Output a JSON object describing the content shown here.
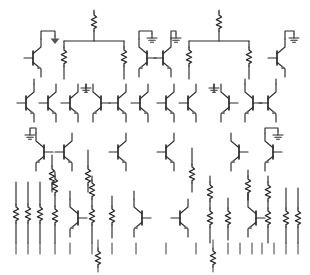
{
  "document": {
    "kind": "circuit-schematic",
    "title": "Transistor and resistor network schematic",
    "background_color": "#ffffff",
    "line_color": "#2b2b2b",
    "width": 310,
    "height": 275
  },
  "legend": {
    "symbols": [
      {
        "name": "resistor",
        "glyph": "zigzag",
        "count": 34
      },
      {
        "name": "bjt-transistor",
        "glyph": "bipolar-junction-transistor",
        "count": 22
      },
      {
        "name": "ground",
        "glyph": "earth-ground",
        "count": 9
      },
      {
        "name": "wire",
        "glyph": "line",
        "count": 60
      }
    ]
  },
  "rows": [
    {
      "id": "row-1",
      "label": "Top row - bias network",
      "y": 10,
      "elements": [
        {
          "type": "bjt",
          "name": "transistor-q1",
          "x": 33,
          "y": 55,
          "facing": "left",
          "ground": true
        },
        {
          "type": "resistor",
          "name": "resistor-r1",
          "x": 94,
          "y": 22,
          "orientation": "vertical"
        },
        {
          "type": "bus",
          "name": "bus-b1",
          "x1": 64,
          "x2": 124,
          "y": 41
        },
        {
          "type": "resistor",
          "name": "resistor-r2",
          "x": 64,
          "y": 57,
          "orientation": "vertical"
        },
        {
          "type": "resistor",
          "name": "resistor-r3",
          "x": 124,
          "y": 57,
          "orientation": "vertical"
        },
        {
          "type": "bjt",
          "name": "transistor-q2",
          "x": 137,
          "y": 55,
          "facing": "right",
          "ground": true
        },
        {
          "type": "bjt",
          "name": "transistor-q3",
          "x": 163,
          "y": 55,
          "facing": "left",
          "ground": true
        },
        {
          "type": "resistor",
          "name": "resistor-r4",
          "x": 219,
          "y": 22,
          "orientation": "vertical"
        },
        {
          "type": "bus",
          "name": "bus-b2",
          "x1": 189,
          "x2": 249,
          "y": 41
        },
        {
          "type": "resistor",
          "name": "resistor-r5",
          "x": 189,
          "y": 57,
          "orientation": "vertical"
        },
        {
          "type": "resistor",
          "name": "resistor-r6",
          "x": 249,
          "y": 57,
          "orientation": "vertical"
        },
        {
          "type": "bjt",
          "name": "transistor-q4",
          "x": 277,
          "y": 55,
          "facing": "right",
          "ground": true
        }
      ]
    },
    {
      "id": "row-2",
      "label": "Second row - transistor bank",
      "y": 85,
      "elements": [
        {
          "type": "bjt",
          "name": "transistor-q5",
          "x": 28,
          "y": 102,
          "facing": "left"
        },
        {
          "type": "bjt",
          "name": "transistor-q6",
          "x": 50,
          "y": 102,
          "facing": "left"
        },
        {
          "type": "bjt",
          "name": "transistor-q7",
          "x": 72,
          "y": 102,
          "facing": "left"
        },
        {
          "type": "ground",
          "name": "ground-g5",
          "x": 88,
          "y": 88
        },
        {
          "type": "bjt",
          "name": "transistor-q8",
          "x": 99,
          "y": 102,
          "facing": "right"
        },
        {
          "type": "bjt",
          "name": "transistor-q9",
          "x": 120,
          "y": 102,
          "facing": "left"
        },
        {
          "type": "bjt",
          "name": "transistor-q10",
          "x": 141,
          "y": 102,
          "facing": "left"
        },
        {
          "type": "bjt",
          "name": "transistor-q11",
          "x": 168,
          "y": 102,
          "facing": "left"
        },
        {
          "type": "bjt",
          "name": "transistor-q12",
          "x": 190,
          "y": 102,
          "facing": "left"
        },
        {
          "type": "ground",
          "name": "ground-g6",
          "x": 216,
          "y": 88
        },
        {
          "type": "bjt",
          "name": "transistor-q13",
          "x": 228,
          "y": 102,
          "facing": "right"
        },
        {
          "type": "bjt",
          "name": "transistor-q14",
          "x": 252,
          "y": 102,
          "facing": "right"
        },
        {
          "type": "bjt",
          "name": "transistor-q15",
          "x": 276,
          "y": 102,
          "facing": "left"
        }
      ]
    },
    {
      "id": "row-3",
      "label": "Third row - mixed transistors and resistors",
      "y": 132,
      "elements": [
        {
          "type": "bjt",
          "name": "transistor-q16",
          "x": 35,
          "y": 152,
          "facing": "right",
          "ground": true
        },
        {
          "type": "resistor",
          "name": "resistor-r7",
          "x": 52,
          "y": 168,
          "orientation": "vertical"
        },
        {
          "type": "bjt",
          "name": "transistor-q17",
          "x": 65,
          "y": 152,
          "facing": "left"
        },
        {
          "type": "resistor",
          "name": "resistor-r8",
          "x": 88,
          "y": 168,
          "orientation": "vertical"
        },
        {
          "type": "bjt",
          "name": "transistor-q18",
          "x": 118,
          "y": 152,
          "facing": "left"
        },
        {
          "type": "bjt",
          "name": "transistor-q19",
          "x": 166,
          "y": 152,
          "facing": "left"
        },
        {
          "type": "resistor",
          "name": "resistor-r9",
          "x": 192,
          "y": 168,
          "orientation": "vertical"
        },
        {
          "type": "bjt",
          "name": "transistor-q20",
          "x": 232,
          "y": 152,
          "facing": "right"
        },
        {
          "type": "resistor",
          "name": "resistor-r10",
          "x": 248,
          "y": 172,
          "orientation": "vertical"
        },
        {
          "type": "bjt",
          "name": "transistor-q21",
          "x": 266,
          "y": 152,
          "facing": "right",
          "ground": true
        }
      ]
    },
    {
      "id": "row-4",
      "label": "Bottom row - resistor ladder",
      "y": 178,
      "elements": [
        {
          "type": "resistor",
          "name": "resistor-r11",
          "x": 16,
          "y": 210,
          "orientation": "vertical"
        },
        {
          "type": "resistor",
          "name": "resistor-r12",
          "x": 28,
          "y": 210,
          "orientation": "vertical"
        },
        {
          "type": "resistor",
          "name": "resistor-r13",
          "x": 40,
          "y": 210,
          "orientation": "vertical"
        },
        {
          "type": "resistor",
          "name": "resistor-r14",
          "x": 55,
          "y": 180,
          "orientation": "vertical"
        },
        {
          "type": "resistor",
          "name": "resistor-r15",
          "x": 55,
          "y": 212,
          "orientation": "vertical"
        },
        {
          "type": "bjt",
          "name": "transistor-q22",
          "x": 72,
          "y": 215,
          "facing": "right"
        },
        {
          "type": "resistor",
          "name": "resistor-r16",
          "x": 92,
          "y": 180,
          "orientation": "vertical"
        },
        {
          "type": "resistor",
          "name": "resistor-r17",
          "x": 92,
          "y": 212,
          "orientation": "vertical"
        },
        {
          "type": "resistor",
          "name": "resistor-r18",
          "x": 112,
          "y": 212,
          "orientation": "vertical"
        },
        {
          "type": "bjt",
          "name": "transistor-q23",
          "x": 136,
          "y": 215,
          "facing": "right"
        },
        {
          "type": "bjt",
          "name": "transistor-q24",
          "x": 180,
          "y": 215,
          "facing": "left"
        },
        {
          "type": "resistor",
          "name": "resistor-r19",
          "x": 210,
          "y": 182,
          "orientation": "vertical"
        },
        {
          "type": "resistor",
          "name": "resistor-r20",
          "x": 210,
          "y": 214,
          "orientation": "vertical"
        },
        {
          "type": "resistor",
          "name": "resistor-r21",
          "x": 228,
          "y": 214,
          "orientation": "vertical"
        },
        {
          "type": "bjt",
          "name": "transistor-q25",
          "x": 248,
          "y": 215,
          "facing": "right"
        },
        {
          "type": "resistor",
          "name": "resistor-r22",
          "x": 268,
          "y": 182,
          "orientation": "vertical"
        },
        {
          "type": "resistor",
          "name": "resistor-r23",
          "x": 268,
          "y": 214,
          "orientation": "vertical"
        },
        {
          "type": "resistor",
          "name": "resistor-r24",
          "x": 286,
          "y": 214,
          "orientation": "vertical"
        },
        {
          "type": "resistor",
          "name": "resistor-r25",
          "x": 298,
          "y": 214,
          "orientation": "vertical"
        }
      ]
    },
    {
      "id": "row-5",
      "label": "Footer terminal stubs",
      "y": 245,
      "elements": [
        {
          "type": "terminal",
          "name": "terminal-stub",
          "count": 20
        },
        {
          "type": "resistor",
          "name": "resistor-r26",
          "x": 98,
          "y": 252,
          "orientation": "vertical"
        },
        {
          "type": "resistor",
          "name": "resistor-r27",
          "x": 213,
          "y": 252,
          "orientation": "vertical"
        }
      ]
    }
  ]
}
